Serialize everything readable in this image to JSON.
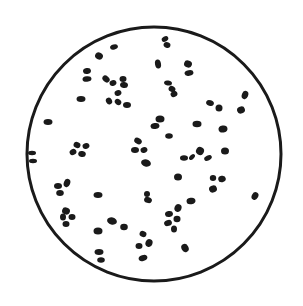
{
  "figure": {
    "background": "#ffffff",
    "ink_color": "#1a1a1a",
    "circle": {
      "cx": 154,
      "cy": 154,
      "r": 127,
      "stroke_width": 3
    },
    "edge_marks": [
      {
        "x": 32,
        "y": 153,
        "rx": 4,
        "ry": 2.2
      },
      {
        "x": 33,
        "y": 161,
        "rx": 4,
        "ry": 2.2
      }
    ],
    "particles": [
      {
        "x": 114,
        "y": 47,
        "rx": 4,
        "ry": 2.5,
        "rot": -15
      },
      {
        "x": 99,
        "y": 56,
        "rx": 4,
        "ry": 3.5,
        "rot": 30
      },
      {
        "x": 87,
        "y": 71,
        "rx": 4,
        "ry": 3,
        "rot": -10
      },
      {
        "x": 87,
        "y": 79,
        "rx": 4.5,
        "ry": 2.8,
        "rot": -5
      },
      {
        "x": 106,
        "y": 79,
        "rx": 4,
        "ry": 3,
        "rot": 40
      },
      {
        "x": 113,
        "y": 83,
        "rx": 3.5,
        "ry": 2.8,
        "rot": -20
      },
      {
        "x": 123,
        "y": 79,
        "rx": 3.5,
        "ry": 3,
        "rot": 0
      },
      {
        "x": 124,
        "y": 85,
        "rx": 4,
        "ry": 3,
        "rot": 10
      },
      {
        "x": 118,
        "y": 93,
        "rx": 3.5,
        "ry": 2.8,
        "rot": -20
      },
      {
        "x": 81,
        "y": 99,
        "rx": 4.5,
        "ry": 3,
        "rot": 0
      },
      {
        "x": 109,
        "y": 101,
        "rx": 3.5,
        "ry": 3,
        "rot": 60
      },
      {
        "x": 118,
        "y": 102,
        "rx": 3.5,
        "ry": 2.8,
        "rot": 40
      },
      {
        "x": 127,
        "y": 105,
        "rx": 4,
        "ry": 3,
        "rot": 0
      },
      {
        "x": 48,
        "y": 122,
        "rx": 4.5,
        "ry": 3,
        "rot": 0
      },
      {
        "x": 165,
        "y": 39,
        "rx": 3.5,
        "ry": 2.5,
        "rot": -30
      },
      {
        "x": 167,
        "y": 45,
        "rx": 3.5,
        "ry": 2.8,
        "rot": 20
      },
      {
        "x": 158,
        "y": 64,
        "rx": 3,
        "ry": 4.5,
        "rot": -10
      },
      {
        "x": 188,
        "y": 64,
        "rx": 4,
        "ry": 3.5,
        "rot": 20
      },
      {
        "x": 189,
        "y": 73,
        "rx": 4.5,
        "ry": 2.8,
        "rot": -10
      },
      {
        "x": 168,
        "y": 83,
        "rx": 4,
        "ry": 2.5,
        "rot": 10
      },
      {
        "x": 172,
        "y": 89,
        "rx": 3.5,
        "ry": 3,
        "rot": 30
      },
      {
        "x": 174,
        "y": 94,
        "rx": 3.5,
        "ry": 3,
        "rot": -30
      },
      {
        "x": 210,
        "y": 103,
        "rx": 4,
        "ry": 2.8,
        "rot": 20
      },
      {
        "x": 219,
        "y": 108,
        "rx": 3.5,
        "ry": 3.5,
        "rot": 0
      },
      {
        "x": 245,
        "y": 95,
        "rx": 3.2,
        "ry": 4.2,
        "rot": 20
      },
      {
        "x": 241,
        "y": 110,
        "rx": 4,
        "ry": 3.5,
        "rot": -20
      },
      {
        "x": 160,
        "y": 119,
        "rx": 4.5,
        "ry": 3.5,
        "rot": 0
      },
      {
        "x": 155,
        "y": 126,
        "rx": 4.5,
        "ry": 3,
        "rot": -10
      },
      {
        "x": 197,
        "y": 124,
        "rx": 4.5,
        "ry": 3.2,
        "rot": 0
      },
      {
        "x": 223,
        "y": 129,
        "rx": 4.5,
        "ry": 3.5,
        "rot": -10
      },
      {
        "x": 169,
        "y": 136,
        "rx": 3.8,
        "ry": 2.8,
        "rot": 0
      },
      {
        "x": 77,
        "y": 145,
        "rx": 3.5,
        "ry": 3,
        "rot": 20
      },
      {
        "x": 86,
        "y": 146,
        "rx": 3.5,
        "ry": 2.8,
        "rot": -20
      },
      {
        "x": 73,
        "y": 152,
        "rx": 3.5,
        "ry": 3,
        "rot": -30
      },
      {
        "x": 82,
        "y": 154,
        "rx": 3.8,
        "ry": 3,
        "rot": 10
      },
      {
        "x": 138,
        "y": 141,
        "rx": 4,
        "ry": 3,
        "rot": 30
      },
      {
        "x": 135,
        "y": 150,
        "rx": 4,
        "ry": 3,
        "rot": 0
      },
      {
        "x": 144,
        "y": 150,
        "rx": 3.5,
        "ry": 2.8,
        "rot": -20
      },
      {
        "x": 146,
        "y": 163,
        "rx": 5,
        "ry": 3.5,
        "rot": 15
      },
      {
        "x": 200,
        "y": 151,
        "rx": 4,
        "ry": 4,
        "rot": 30
      },
      {
        "x": 208,
        "y": 158,
        "rx": 4,
        "ry": 2.5,
        "rot": -25
      },
      {
        "x": 184,
        "y": 158,
        "rx": 4,
        "ry": 2.8,
        "rot": 0
      },
      {
        "x": 192,
        "y": 157,
        "rx": 3.5,
        "ry": 2.2,
        "rot": -45
      },
      {
        "x": 225,
        "y": 151,
        "rx": 4,
        "ry": 3.5,
        "rot": 0
      },
      {
        "x": 178,
        "y": 177,
        "rx": 4,
        "ry": 3.5,
        "rot": 0
      },
      {
        "x": 213,
        "y": 178,
        "rx": 3.2,
        "ry": 3,
        "rot": 0
      },
      {
        "x": 222,
        "y": 179,
        "rx": 3.8,
        "ry": 3.2,
        "rot": -10
      },
      {
        "x": 213,
        "y": 189,
        "rx": 4,
        "ry": 3.5,
        "rot": -20
      },
      {
        "x": 255,
        "y": 196,
        "rx": 3.2,
        "ry": 4,
        "rot": 30
      },
      {
        "x": 191,
        "y": 201,
        "rx": 4.5,
        "ry": 3.2,
        "rot": -10
      },
      {
        "x": 67,
        "y": 183,
        "rx": 3.2,
        "ry": 4.2,
        "rot": 20
      },
      {
        "x": 58,
        "y": 186,
        "rx": 4,
        "ry": 3,
        "rot": 0
      },
      {
        "x": 60,
        "y": 193,
        "rx": 3.8,
        "ry": 3,
        "rot": 0
      },
      {
        "x": 98,
        "y": 195,
        "rx": 4.5,
        "ry": 3,
        "rot": 0
      },
      {
        "x": 147,
        "y": 194,
        "rx": 3,
        "ry": 3,
        "rot": 0
      },
      {
        "x": 148,
        "y": 200,
        "rx": 4,
        "ry": 3,
        "rot": 20
      },
      {
        "x": 61,
        "y": 194,
        "rx": 0,
        "ry": 0,
        "rot": 0
      },
      {
        "x": 66,
        "y": 211,
        "rx": 4,
        "ry": 3.5,
        "rot": 20
      },
      {
        "x": 63,
        "y": 217,
        "rx": 3,
        "ry": 3.5,
        "rot": 0
      },
      {
        "x": 72,
        "y": 217,
        "rx": 3.5,
        "ry": 3,
        "rot": 0
      },
      {
        "x": 66,
        "y": 224,
        "rx": 3.5,
        "ry": 3,
        "rot": 0
      },
      {
        "x": 112,
        "y": 221,
        "rx": 5,
        "ry": 3.5,
        "rot": 15
      },
      {
        "x": 124,
        "y": 227,
        "rx": 3.8,
        "ry": 3.2,
        "rot": 0
      },
      {
        "x": 98,
        "y": 231,
        "rx": 4.5,
        "ry": 3.5,
        "rot": 0
      },
      {
        "x": 178,
        "y": 208,
        "rx": 3.5,
        "ry": 4,
        "rot": 20
      },
      {
        "x": 169,
        "y": 214,
        "rx": 4,
        "ry": 3,
        "rot": -10
      },
      {
        "x": 177,
        "y": 219,
        "rx": 3.5,
        "ry": 3.2,
        "rot": 0
      },
      {
        "x": 168,
        "y": 223,
        "rx": 4,
        "ry": 3,
        "rot": -20
      },
      {
        "x": 174,
        "y": 229,
        "rx": 3,
        "ry": 3.5,
        "rot": 0
      },
      {
        "x": 143,
        "y": 234,
        "rx": 3.5,
        "ry": 3,
        "rot": 20
      },
      {
        "x": 149,
        "y": 243,
        "rx": 3.5,
        "ry": 4,
        "rot": 20
      },
      {
        "x": 139,
        "y": 246,
        "rx": 3.5,
        "ry": 3,
        "rot": 0
      },
      {
        "x": 185,
        "y": 248,
        "rx": 3.5,
        "ry": 4.2,
        "rot": -30
      },
      {
        "x": 99,
        "y": 252,
        "rx": 4.5,
        "ry": 3,
        "rot": 0
      },
      {
        "x": 101,
        "y": 260,
        "rx": 3.8,
        "ry": 2.8,
        "rot": 0
      },
      {
        "x": 143,
        "y": 258,
        "rx": 4.5,
        "ry": 3,
        "rot": -20
      }
    ]
  }
}
